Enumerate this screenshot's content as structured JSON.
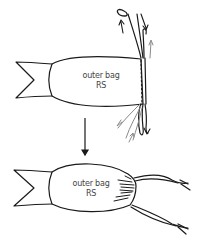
{
  "diagram": {
    "type": "sewing-instruction",
    "panels": [
      {
        "id": "before",
        "label_line1": "outer bag",
        "label_line2": "RS",
        "description": "Bag with casing at right edge, drawstrings threaded with directional arrows"
      },
      {
        "id": "after",
        "label_line1": "outer bag",
        "label_line2": "RS",
        "description": "Bag gathered at right edge with drawstring ends extending"
      }
    ],
    "transition_arrow": "down-arrow",
    "colors": {
      "stroke": "#1a1a1a",
      "arrow_gray": "#8a8a8a",
      "text": "#444444",
      "background": "#ffffff"
    }
  }
}
